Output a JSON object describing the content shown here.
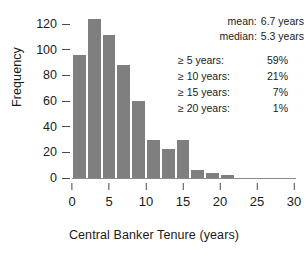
{
  "chart_data": {
    "type": "bar",
    "title": "",
    "xlabel": "Central Banker Tenure (years)",
    "ylabel": "Frequency",
    "xlim": [
      0,
      30
    ],
    "ylim": [
      0,
      128
    ],
    "grid": false,
    "legend": null,
    "bin_width": 2,
    "bar_color": "#7f7f7f",
    "xticks": [
      0,
      5,
      10,
      15,
      20,
      25,
      30
    ],
    "xtick_labels": [
      "0",
      "5",
      "10",
      "15",
      "20",
      "25",
      "30"
    ],
    "yticks": [
      0,
      20,
      40,
      60,
      80,
      100,
      120
    ],
    "ytick_labels": [
      "0",
      "20",
      "40",
      "60",
      "80",
      "100",
      "120"
    ],
    "bins": [
      {
        "start": 0,
        "end": 2,
        "value": 96
      },
      {
        "start": 2,
        "end": 4,
        "value": 124
      },
      {
        "start": 4,
        "end": 6,
        "value": 112
      },
      {
        "start": 6,
        "end": 8,
        "value": 88
      },
      {
        "start": 8,
        "end": 10,
        "value": 60
      },
      {
        "start": 10,
        "end": 12,
        "value": 30
      },
      {
        "start": 12,
        "end": 14,
        "value": 23
      },
      {
        "start": 14,
        "end": 16,
        "value": 30
      },
      {
        "start": 16,
        "end": 18,
        "value": 6
      },
      {
        "start": 18,
        "end": 20,
        "value": 4
      },
      {
        "start": 20,
        "end": 22,
        "value": 2
      },
      {
        "start": 22,
        "end": 24,
        "value": 0
      },
      {
        "start": 24,
        "end": 26,
        "value": 0
      },
      {
        "start": 26,
        "end": 28,
        "value": 0
      },
      {
        "start": 28,
        "end": 30,
        "value": 0
      }
    ],
    "categories": [
      "0-2",
      "2-4",
      "4-6",
      "6-8",
      "8-10",
      "10-12",
      "12-14",
      "14-16",
      "16-18",
      "18-20",
      "20-22",
      "22-24",
      "24-26",
      "26-28",
      "28-30"
    ],
    "values": [
      96,
      124,
      112,
      88,
      60,
      30,
      23,
      30,
      6,
      4,
      2,
      0,
      0,
      0,
      0
    ],
    "annotations": {
      "summary_stats": [
        {
          "key": "mean:",
          "value": "6.7 years"
        },
        {
          "key": "median:",
          "value": "5.3 years"
        }
      ],
      "thresholds": [
        {
          "key": "≥ 5 years:",
          "value": "59%"
        },
        {
          "key": "≥ 10 years:",
          "value": "21%"
        },
        {
          "key": "≥ 15 years:",
          "value": "7%"
        },
        {
          "key": "≥ 20 years:",
          "value": "1%"
        }
      ]
    }
  }
}
